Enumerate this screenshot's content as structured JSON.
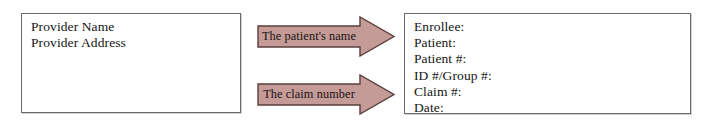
{
  "diagram": {
    "background_color": "#ffffff",
    "provider_box": {
      "name": "provider-box",
      "border_color": "#6b6b6b",
      "lines": [
        "Provider Name",
        "Provider Address"
      ]
    },
    "arrows": [
      {
        "name": "arrow-patient-name",
        "label": "The patient's name",
        "direction": "right",
        "fill_color": "#c49b97",
        "outline_color": "#5a3f3c"
      },
      {
        "name": "arrow-claim-number",
        "label": "The claim number",
        "direction": "right",
        "fill_color": "#c49b97",
        "outline_color": "#5a3f3c"
      }
    ],
    "claim_fields_box": {
      "name": "claim-fields-box",
      "border_color": "#6b6b6b",
      "lines": [
        "Enrollee:",
        "Patient:",
        "Patient #:",
        "ID #/Group #:",
        "Claim #:",
        "Date:"
      ]
    }
  }
}
